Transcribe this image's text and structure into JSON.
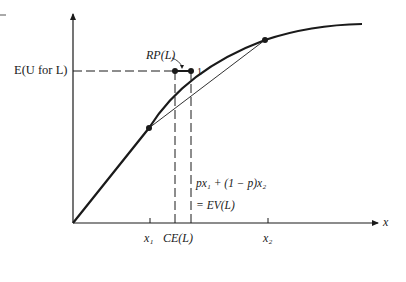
{
  "diagram": {
    "labels": {
      "y_level": "E(U for L)",
      "risk_premium": "RP(L)",
      "point_one": "1",
      "ev_line1": "px₁ + (1 − p)x₂",
      "ev_line2": "= EV(L)",
      "x1": "x₁",
      "ce": "CE(L)",
      "x2": "x₂",
      "x_axis": "x"
    },
    "colors": {
      "ink": "#1a1a1a",
      "background": "#ffffff"
    }
  }
}
